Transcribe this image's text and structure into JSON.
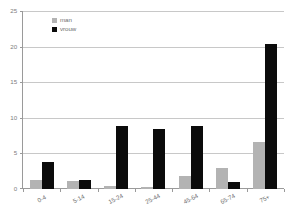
{
  "chart_data": {
    "type": "bar",
    "title": "",
    "subtitle": "",
    "xlabel": "",
    "ylabel": "",
    "categories": [
      "0-4",
      "5-14",
      "15-24",
      "25-44",
      "45-64",
      "65-74",
      "75+"
    ],
    "series": [
      {
        "name": "man",
        "color": "#b3b3b3",
        "values": [
          1.2,
          1.1,
          0.4,
          0.25,
          1.8,
          2.9,
          6.6
        ]
      },
      {
        "name": "vrouw",
        "color": "#0b0b0b",
        "values": [
          3.8,
          1.3,
          8.9,
          8.4,
          8.9,
          1.0,
          20.4
        ]
      }
    ],
    "ylim": [
      0,
      25
    ],
    "yticks": [
      0,
      5,
      10,
      15,
      20,
      25
    ],
    "ytick_labels": [
      "0",
      "5",
      "10",
      "15",
      "20",
      "25"
    ],
    "grid": true,
    "grid_axis": "y",
    "legend_position": "top-left-inside",
    "annotations": []
  },
  "legend": {
    "entries": [
      {
        "label": "man"
      },
      {
        "label": "vrouw"
      }
    ]
  },
  "axes": {
    "y": {
      "labels": [
        "25",
        "20",
        "15",
        "10",
        "5",
        "0"
      ],
      "min": 0,
      "max": 25
    },
    "x": {
      "labels": [
        "0-4",
        "5-14",
        "15-24",
        "25-44",
        "45-64",
        "65-74",
        "75+"
      ]
    }
  },
  "colors": {
    "series_man": "#b3b3b3",
    "series_vrouw": "#0b0b0b",
    "gridline": "#c8c8c8",
    "axis": "#9a9a9a",
    "text": "#6f6f6f",
    "background": "#ffffff"
  }
}
